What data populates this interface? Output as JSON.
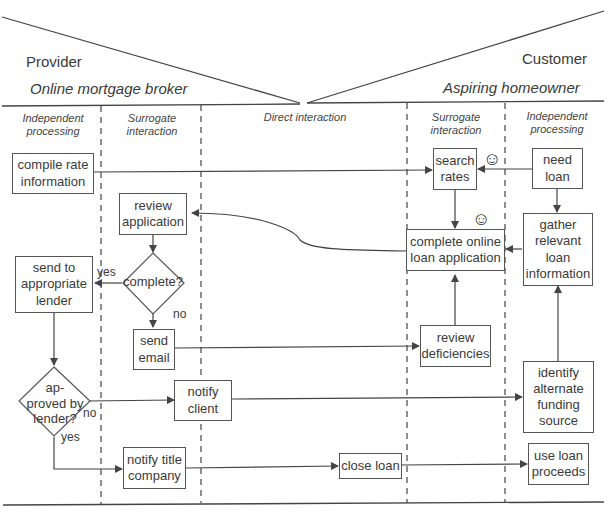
{
  "header": {
    "provider_role": "Provider",
    "provider_entity": "Online mortgage broker",
    "customer_role": "Customer",
    "customer_entity": "Aspiring homeowner"
  },
  "zones": [
    {
      "id": "provider-independent",
      "label": "Independent\nprocessing"
    },
    {
      "id": "provider-surrogate",
      "label": "Surrogate\ninteraction"
    },
    {
      "id": "direct",
      "label": "Direct interaction"
    },
    {
      "id": "customer-surrogate",
      "label": "Surrogate\ninteraction"
    },
    {
      "id": "customer-independent",
      "label": "Independent\nprocessing"
    }
  ],
  "steps": {
    "compile_rate_information": "compile rate\ninformation",
    "review_application": "review\napplication",
    "complete_decision": "complete?",
    "send_to_lender": "send to\nappropriate\nlender",
    "send_email": "send\nemail",
    "approved_decision": "ap-\nproved by\nlender?",
    "notify_client": "notify\nclient",
    "notify_title_company": "notify title\ncompany",
    "close_loan": "close loan",
    "search_rates": "search\nrates",
    "complete_online_application": "complete online\nloan application",
    "review_deficiencies": "review\ndeficiencies",
    "need_loan": "need\nloan",
    "gather_loan_information": "gather\nrelevant\nloan\ninformation",
    "identify_alternate_funding": "identify\nalternate\nfunding\nsource",
    "use_loan_proceeds": "use loan\nproceeds"
  },
  "branch_labels": {
    "complete_yes": "yes",
    "complete_no": "no",
    "approved_no": "no",
    "approved_yes": "yes"
  },
  "icons": {
    "smiley": "☺"
  },
  "colors": {
    "line": "#444444",
    "text": "#3a3a3a",
    "background": "#ffffff"
  }
}
